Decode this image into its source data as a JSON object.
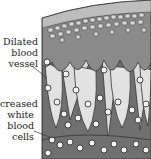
{
  "diagram": {
    "labels": [
      {
        "id": "dilated-blood-vessel",
        "lines": [
          "Dilated",
          "blood",
          "vessel"
        ]
      },
      {
        "id": "increased-white-blood-cells",
        "lines": [
          "creased",
          "white",
          "blood",
          "cells"
        ]
      }
    ],
    "colors": {
      "surface_layer": "#b8b8b8",
      "cell_layer": "#8a8a8a",
      "cell_fill": "#d9d9d9",
      "dermis_dark": "#6e6e6e",
      "dermis_light": "#dcdcdc",
      "outline": "#333333"
    }
  }
}
